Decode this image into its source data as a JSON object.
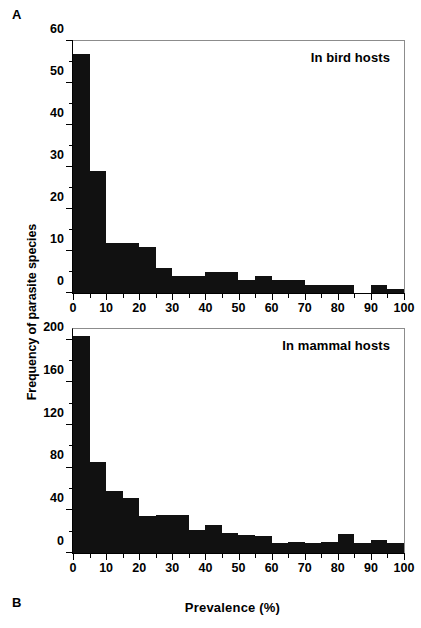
{
  "figure": {
    "panel_a_label": "A",
    "panel_b_label": "B",
    "y_axis_title": "Frequency of parasite species",
    "x_axis_title": "Prevalence (%)"
  },
  "chart_data": [
    {
      "type": "bar",
      "title": "In bird hosts",
      "panel": "A",
      "xlabel": "Prevalence (%)",
      "ylabel": "Frequency of parasite species",
      "xlim": [
        0,
        100
      ],
      "ylim": [
        0,
        60
      ],
      "grid": false,
      "legend": "none",
      "bin_width": 5,
      "x_ticks": [
        0,
        10,
        20,
        30,
        40,
        50,
        60,
        70,
        80,
        90,
        100
      ],
      "x_minor_ticks": [
        5,
        15,
        25,
        35,
        45,
        55,
        65,
        75,
        85,
        95
      ],
      "y_ticks": [
        0,
        10,
        20,
        30,
        40,
        50,
        60
      ],
      "y_minor_ticks": [
        5,
        15,
        25,
        35,
        45,
        55
      ],
      "categories": [
        "0-5",
        "5-10",
        "10-15",
        "15-20",
        "20-25",
        "25-30",
        "30-35",
        "35-40",
        "40-45",
        "45-50",
        "50-55",
        "55-60",
        "60-65",
        "65-70",
        "70-75",
        "75-80",
        "80-85",
        "85-90",
        "90-95",
        "95-100"
      ],
      "values": [
        57,
        29,
        12,
        12,
        11,
        6,
        4,
        4,
        5,
        5,
        3,
        4,
        3,
        3,
        2,
        2,
        2,
        0,
        2,
        1
      ],
      "bar_color": "#111111"
    },
    {
      "type": "bar",
      "title": "In mammal hosts",
      "panel": "B",
      "xlabel": "Prevalence (%)",
      "ylabel": "Frequency of parasite species",
      "xlim": [
        0,
        100
      ],
      "ylim": [
        0,
        210
      ],
      "grid": false,
      "legend": "none",
      "bin_width": 5,
      "x_ticks": [
        0,
        10,
        20,
        30,
        40,
        50,
        60,
        70,
        80,
        90,
        100
      ],
      "x_minor_ticks": [
        5,
        15,
        25,
        35,
        45,
        55,
        65,
        75,
        85,
        95
      ],
      "y_ticks": [
        0,
        40,
        80,
        120,
        160,
        200
      ],
      "y_minor_ticks": [
        20,
        60,
        100,
        140,
        180
      ],
      "categories": [
        "0-5",
        "5-10",
        "10-15",
        "15-20",
        "20-25",
        "25-30",
        "30-35",
        "35-40",
        "40-45",
        "45-50",
        "50-55",
        "55-60",
        "60-65",
        "65-70",
        "70-75",
        "75-80",
        "80-85",
        "85-90",
        "90-95",
        "95-100"
      ],
      "values": [
        203,
        85,
        58,
        52,
        35,
        36,
        36,
        22,
        26,
        19,
        17,
        16,
        9,
        10,
        9,
        10,
        18,
        9,
        12,
        9
      ],
      "bar_color": "#111111"
    }
  ]
}
